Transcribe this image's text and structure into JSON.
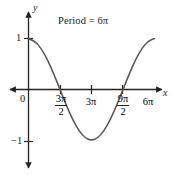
{
  "figure": {
    "title": "Period = 6π",
    "axis_label_x": "x",
    "axis_label_y": "y",
    "origin_label": "0",
    "ytick_labels": {
      "top": "1",
      "bottom": "−1"
    },
    "xtick_labels": {
      "t1_num": "3π",
      "t1_den": "2",
      "t2": "3π",
      "t3_num": "9π",
      "t3_den": "2",
      "t4": "6π"
    },
    "colors": {
      "axis": "#262220",
      "curve": "#5b5550",
      "background": "#ffffff",
      "text": "#262220"
    }
  },
  "chart_data": {
    "type": "line",
    "title": "Period = 6π",
    "xlabel": "x",
    "ylabel": "y",
    "function": "y = cos(x/3)",
    "period": "6π",
    "amplitude": 1,
    "xlim": [
      0,
      6.283185307179586
    ],
    "ylim": [
      -1,
      1
    ],
    "grid": false,
    "legend": false,
    "xtick_values": [
      4.71238898038469,
      9.42477796076938,
      14.137166941154069,
      18.84955592153876
    ],
    "xtick_labels": [
      "3π/2",
      "3π",
      "9π/2",
      "6π"
    ],
    "ytick_values": [
      1,
      -1
    ],
    "ytick_labels": [
      "1",
      "−1"
    ],
    "annotations": [
      "Period = 6π"
    ],
    "series": [
      {
        "name": "y = cos(x/3)",
        "x": [
          0.0,
          0.9424778,
          1.8849556,
          2.8274334,
          3.7699112,
          4.712389,
          5.6548668,
          6.5973446,
          7.5398224,
          8.4823002,
          9.424778,
          10.3672558,
          11.3097336,
          12.2522114,
          13.1946892,
          14.137167,
          15.0796448,
          16.0221226,
          16.9646004,
          17.9070782,
          18.849556
        ],
        "y": [
          1.0,
          0.9510565,
          0.809017,
          0.5877853,
          0.309017,
          0.0,
          -0.309017,
          -0.5877853,
          -0.809017,
          -0.9510565,
          -1.0,
          -0.9510565,
          -0.809017,
          -0.5877853,
          -0.309017,
          0.0,
          0.309017,
          0.5877853,
          0.809017,
          0.9510565,
          1.0
        ]
      }
    ]
  }
}
